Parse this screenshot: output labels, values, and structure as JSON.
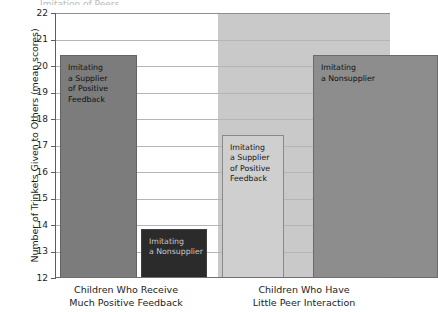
{
  "figure": {
    "cropped_title_fragment": "Imitation of Peers",
    "ylabel": "Number of Trinkets Given to Others (mean scores)"
  },
  "chart_data": {
    "type": "bar",
    "title": "",
    "xlabel": "",
    "ylabel": "Number of Trinkets Given to Others (mean scores)",
    "ylim": [
      12,
      22
    ],
    "ytick_labels": [
      "22",
      "21",
      "20",
      "19",
      "18",
      "17",
      "16",
      "15",
      "14",
      "13",
      "12"
    ],
    "ytick_values": [
      22,
      21,
      20,
      19,
      18,
      17,
      16,
      15,
      14,
      13,
      12
    ],
    "grid": true,
    "legend_position": "none",
    "groups": [
      {
        "name": "Children Who Receive Much Positive Feedback",
        "label_line1": "Children Who Receive",
        "label_line2": "Much Positive Feedback",
        "panel_background": "#ffffff",
        "bars": [
          {
            "label": "Imitating\na Supplier\nof Positive\nFeedback",
            "value": 20.4,
            "color": "#7c7c7c",
            "tone": "mid"
          },
          {
            "label": "Imitating\na Nonsupplier",
            "value": 13.85,
            "color": "#2b2b2b",
            "tone": "dark"
          }
        ]
      },
      {
        "name": "Children Who Have Little Peer Interaction",
        "label_line1": "Children Who Have",
        "label_line2": "Little Peer Interaction",
        "panel_background": "#c9c9c9",
        "bars": [
          {
            "label": "Imitating\na Supplier\nof Positive\nFeedback",
            "value": 17.4,
            "color": "#cfcfcf",
            "tone": "light"
          },
          {
            "label": "Imitating\na Nonsupplier",
            "value": 20.4,
            "color": "#8d8d8d",
            "tone": "mid"
          }
        ]
      }
    ]
  }
}
